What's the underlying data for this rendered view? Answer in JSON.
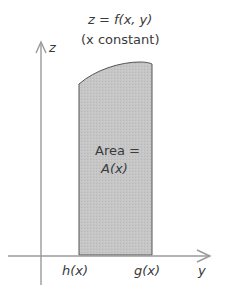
{
  "figure": {
    "function_label": "z = f(x, y)",
    "condition_label": "(x constant)",
    "area_label_line1": "Area =",
    "area_label_line2": "A(x)",
    "z_axis_label": "z",
    "y_axis_label": "y",
    "lower_bound_label": "h(x)",
    "upper_bound_label": "g(x)",
    "colors": {
      "region_fill": "#c4c4c4",
      "region_stroke": "#555555",
      "axis": "#9a9a9a",
      "text": "#3a3a3a"
    }
  }
}
